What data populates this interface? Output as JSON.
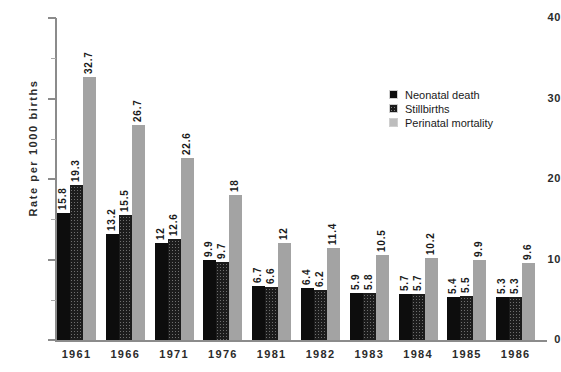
{
  "chart_data": {
    "type": "bar",
    "title": "",
    "xlabel": "",
    "ylabel": "Rate  per  1000  births",
    "ylim": [
      0,
      40
    ],
    "yticks": [
      0,
      10,
      20,
      30,
      40
    ],
    "ytick_labels": [
      "0",
      "10",
      "20",
      "30",
      "40"
    ],
    "yminor_ticks": [
      5,
      15,
      25,
      35
    ],
    "grid": false,
    "legend_position": "upper right",
    "categories": [
      "1961",
      "1966",
      "1971",
      "1976",
      "1981",
      "1982",
      "1983",
      "1984",
      "1985",
      "1986"
    ],
    "series": [
      {
        "name": "Neonatal death",
        "color": "#0d0d0d",
        "pattern": "solid",
        "values": [
          15.8,
          13.2,
          12,
          9.9,
          6.7,
          6.4,
          5.9,
          5.7,
          5.4,
          5.3
        ],
        "labels": [
          "15.8",
          "13.2",
          "12",
          "9.9",
          "6.7",
          "6.4",
          "5.9",
          "5.7",
          "5.4",
          "5.3"
        ]
      },
      {
        "name": "Stillbirths",
        "color": "#6e6e6e",
        "pattern": "cross-hatch",
        "values": [
          19.3,
          15.5,
          12.6,
          9.7,
          6.6,
          6.2,
          5.8,
          5.7,
          5.5,
          5.3
        ],
        "labels": [
          "19.3",
          "15.5",
          "12.6",
          "9.7",
          "6.6",
          "6.2",
          "5.8",
          "5.7",
          "5.5",
          "5.3"
        ]
      },
      {
        "name": "Perinatal mortality",
        "color": "#a3a3a3",
        "pattern": "solid",
        "values": [
          32.7,
          26.7,
          22.6,
          18,
          12,
          11.4,
          10.5,
          10.2,
          9.9,
          9.6
        ],
        "labels": [
          "32.7",
          "26.7",
          "22.6",
          "18",
          "12",
          "11.4",
          "10.5",
          "10.2",
          "9.9",
          "9.6"
        ]
      }
    ]
  },
  "legend": {
    "items": [
      {
        "label": "Neonatal death"
      },
      {
        "label": "Stillbirths"
      },
      {
        "label": "Perinatal mortality"
      }
    ]
  }
}
